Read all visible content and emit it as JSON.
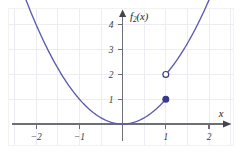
{
  "figure": {
    "background_color": "#ffffff",
    "border_color": "#f1f1f1",
    "axis_color": "#6e6e78",
    "grid_color": "#ececf2",
    "curve_color": "#5b5bb0",
    "marker_fill_color": "#3a3a8c",
    "marker_edge_color": "#3a3a8c",
    "open_marker_fill": "#ffffff"
  },
  "axes": {
    "y_axis_label": "f",
    "y_axis_label_sub": "2",
    "y_axis_label_arg": "(x)",
    "x_axis_label": "x",
    "x_ticks": [
      "−2",
      "−1",
      "1",
      "2"
    ],
    "x_tick_values": [
      -2,
      -1,
      1,
      2
    ],
    "y_ticks": [
      "1",
      "2",
      "3",
      "4"
    ],
    "y_tick_values": [
      1,
      2,
      3,
      4
    ],
    "xlim": [
      -2.65,
      2.55
    ],
    "ylim": [
      -0.6,
      5.1
    ],
    "grid": true,
    "x_grid_step": 0.5,
    "y_grid_step": 1
  },
  "chart_data": {
    "type": "line",
    "title": "",
    "xlabel": "x",
    "ylabel": "f_2(x)",
    "xlim": [
      -2.65,
      2.55
    ],
    "ylim": [
      -0.6,
      5.1
    ],
    "grid": true,
    "legend": null,
    "series": [
      {
        "name": "f_2(x) = x^2 on (-inf, 1)",
        "type": "line",
        "color": "#5b5bb0",
        "function": "y = x^2",
        "x_start": -2.42,
        "x_end": 1.0,
        "x": [
          -2.42,
          -2.2,
          -2.0,
          -1.8,
          -1.6,
          -1.4,
          -1.2,
          -1.0,
          -0.8,
          -0.6,
          -0.4,
          -0.2,
          0.0,
          0.2,
          0.4,
          0.6,
          0.8,
          1.0
        ],
        "values": [
          5.86,
          4.84,
          4.0,
          3.24,
          2.56,
          1.96,
          1.44,
          1.0,
          0.64,
          0.36,
          0.16,
          0.04,
          0.0,
          0.04,
          0.16,
          0.36,
          0.64,
          1.0
        ]
      },
      {
        "name": "f_2(x) = x^2 + 1 on (1, inf)",
        "type": "line",
        "color": "#5b5bb0",
        "function": "y = x^2 + 1",
        "x_start": 1.0,
        "x_end": 2.45,
        "x": [
          1.0,
          1.2,
          1.4,
          1.6,
          1.8,
          2.0,
          2.2,
          2.45
        ],
        "values": [
          2.0,
          2.44,
          2.96,
          3.56,
          4.24,
          5.0,
          5.84,
          7.0
        ]
      }
    ],
    "points": [
      {
        "name": "closed-endpoint",
        "x": 1,
        "y": 1,
        "style": "filled",
        "color": "#3a3a8c",
        "label": "(1, 1)"
      },
      {
        "name": "open-endpoint",
        "x": 1,
        "y": 2,
        "style": "open",
        "color": "#3a3a8c",
        "label": "(1, 2)"
      }
    ],
    "annotations": []
  }
}
